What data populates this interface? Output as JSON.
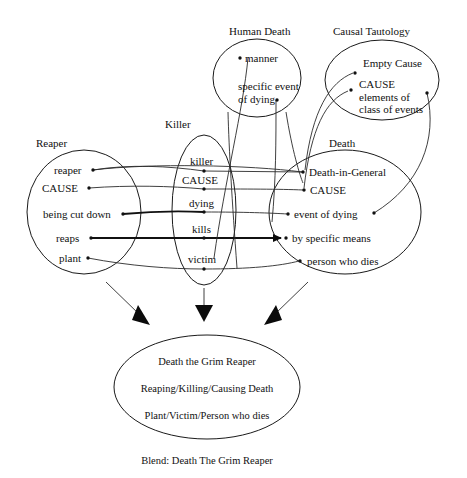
{
  "diagram": {
    "title": "Blend: Death The Grim Reaper",
    "caption": "Blend: Death The Grim Reaper",
    "line_color": "#1a1a1a",
    "arrow_color": "#0b0b0b",
    "background": "#ffffff"
  },
  "spaces": {
    "human_death": {
      "label": "Human Death",
      "elements": [
        {
          "text": "manner"
        },
        {
          "text": "specific event"
        },
        {
          "text": "of dying"
        }
      ]
    },
    "causal_tautology": {
      "label": "Causal Tautology",
      "elements": [
        {
          "text": "Empty Cause"
        },
        {
          "text": "CAUSE"
        },
        {
          "text": "elements of"
        },
        {
          "text": "class of events"
        }
      ]
    },
    "reaper": {
      "label": "Reaper",
      "elements": [
        {
          "text": "reaper"
        },
        {
          "text": "CAUSE"
        },
        {
          "text": "being cut down"
        },
        {
          "text": "reaps"
        },
        {
          "text": "plant"
        }
      ]
    },
    "killer": {
      "label": "Killer",
      "elements": [
        {
          "text": "killer"
        },
        {
          "text": "CAUSE"
        },
        {
          "text": "dying"
        },
        {
          "text": "kills"
        },
        {
          "text": "victim"
        }
      ]
    },
    "death": {
      "label": "Death",
      "elements": [
        {
          "text": "Death-in-General"
        },
        {
          "text": "CAUSE"
        },
        {
          "text": "event of dying"
        },
        {
          "text": "by specific means"
        },
        {
          "text": "person who dies"
        }
      ]
    },
    "blend": {
      "label": "Blend: Death The Grim Reaper",
      "elements": [
        {
          "text": "Death the Grim Reaper"
        },
        {
          "text": "Reaping/Killing/Causing Death"
        },
        {
          "text": "Plant/Victim/Person who dies"
        }
      ]
    }
  },
  "arrows": [
    {
      "name": "arrow-reaper-to-blend",
      "direction": "down-right"
    },
    {
      "name": "arrow-killer-to-blend",
      "direction": "down"
    },
    {
      "name": "arrow-death-to-blend",
      "direction": "down-left"
    }
  ]
}
